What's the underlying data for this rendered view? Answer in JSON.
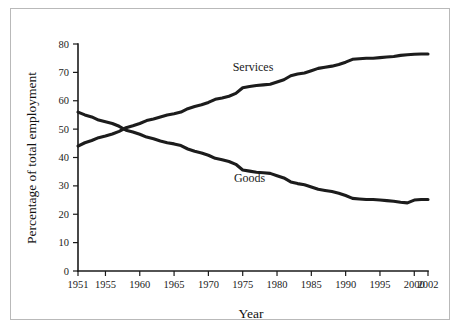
{
  "chart_data": {
    "type": "line",
    "title": "",
    "xlabel": "Year",
    "ylabel": "Percentage of total employment",
    "xlim": [
      1951,
      2002
    ],
    "ylim": [
      0,
      80
    ],
    "grid": false,
    "legend": "inline-labels",
    "xticks": [
      1951,
      1955,
      1960,
      1965,
      1970,
      1975,
      1980,
      1985,
      1990,
      1995,
      2000,
      2002
    ],
    "xtick_labels": [
      "1951",
      "1955",
      "1960",
      "1965",
      "1970",
      "1975",
      "1980",
      "1985",
      "1990",
      "1995",
      "2000",
      "2002"
    ],
    "yticks": [
      0,
      10,
      20,
      30,
      40,
      50,
      60,
      70,
      80
    ],
    "ytick_labels": [
      "0",
      "10",
      "20",
      "30",
      "40",
      "50",
      "60",
      "70",
      "80"
    ],
    "x": [
      1951,
      1952,
      1953,
      1954,
      1955,
      1956,
      1957,
      1958,
      1959,
      1960,
      1961,
      1962,
      1963,
      1964,
      1965,
      1966,
      1967,
      1968,
      1969,
      1970,
      1971,
      1972,
      1973,
      1974,
      1975,
      1976,
      1977,
      1978,
      1979,
      1980,
      1981,
      1982,
      1983,
      1984,
      1985,
      1986,
      1987,
      1988,
      1989,
      1990,
      1991,
      1992,
      1993,
      1994,
      1995,
      1996,
      1997,
      1998,
      1999,
      2000,
      2001,
      2002
    ],
    "series": [
      {
        "name": "Services",
        "label": "Services",
        "color": "#1c1c1c",
        "label_position": {
          "x": 1976.5,
          "y": 70.5
        },
        "values": [
          44.0,
          45.2,
          46.0,
          47.0,
          47.6,
          48.3,
          49.2,
          50.5,
          51.2,
          52.0,
          53.0,
          53.6,
          54.3,
          55.0,
          55.4,
          56.0,
          57.2,
          58.0,
          58.6,
          59.4,
          60.5,
          61.0,
          61.6,
          62.6,
          64.6,
          65.0,
          65.4,
          65.6,
          65.8,
          66.6,
          67.4,
          68.8,
          69.4,
          69.8,
          70.6,
          71.4,
          71.8,
          72.2,
          72.8,
          73.6,
          74.6,
          74.8,
          75.0,
          75.0,
          75.2,
          75.4,
          75.6,
          76.0,
          76.2,
          76.4,
          76.5,
          76.5
        ]
      },
      {
        "name": "Goods",
        "label": "Goods",
        "color": "#1c1c1c",
        "label_position": {
          "x": 1976.0,
          "y": 31.5
        },
        "values": [
          56.0,
          55.0,
          54.3,
          53.2,
          52.6,
          52.0,
          51.0,
          49.6,
          49.0,
          48.2,
          47.2,
          46.6,
          45.8,
          45.2,
          44.8,
          44.2,
          43.0,
          42.2,
          41.6,
          40.8,
          39.7,
          39.2,
          38.6,
          37.6,
          35.6,
          35.2,
          34.8,
          34.6,
          34.4,
          33.6,
          32.8,
          31.4,
          30.8,
          30.4,
          29.6,
          28.8,
          28.4,
          28.0,
          27.4,
          26.6,
          25.6,
          25.4,
          25.2,
          25.2,
          25.0,
          24.8,
          24.6,
          24.2,
          24.0,
          25.0,
          25.2,
          25.2
        ]
      }
    ]
  }
}
